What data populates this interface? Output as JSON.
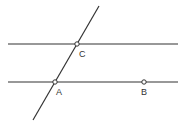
{
  "diagram": {
    "lines": [
      {
        "id": "line-top",
        "x1": 8,
        "y1": 44,
        "x2": 178,
        "y2": 44
      },
      {
        "id": "line-bottom",
        "x1": 8,
        "y1": 82,
        "x2": 178,
        "y2": 82
      },
      {
        "id": "line-transversal",
        "x1": 99,
        "y1": 6,
        "x2": 33,
        "y2": 120
      }
    ],
    "points": [
      {
        "label": "C",
        "x": 77,
        "y": 44
      },
      {
        "label": "A",
        "x": 55,
        "y": 82
      },
      {
        "label": "B",
        "x": 144,
        "y": 82
      }
    ],
    "colors": {
      "stroke": "#333333",
      "point_fill": "#ffffff"
    }
  }
}
